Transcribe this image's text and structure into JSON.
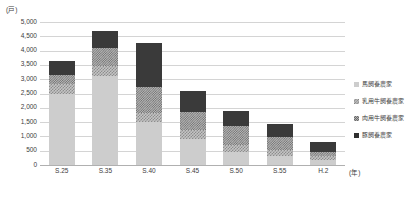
{
  "chart_data": {
    "type": "bar",
    "subtype": "stacked-bar",
    "title": "",
    "xlabel": "年",
    "ylabel": "戸",
    "y_unit_label": "(戸)",
    "x_unit_label": "(年)",
    "ylim": [
      0,
      5000
    ],
    "ytick_step": 500,
    "grid": true,
    "legend_position": "right",
    "categories": [
      "S.25",
      "S.35",
      "S.40",
      "S.45",
      "S.50",
      "S.55",
      "H.2"
    ],
    "yticks": [
      "0",
      "500",
      "1,000",
      "1,500",
      "2,000",
      "2,500",
      "3,000",
      "3,500",
      "4,000",
      "4,500",
      "5,000"
    ],
    "series": [
      {
        "name": "馬飼養農家",
        "key": "horse",
        "color": "#cdcdcd",
        "values": [
          2500,
          3100,
          1500,
          900,
          450,
          300,
          180
        ]
      },
      {
        "name": "乳用牛飼養農家",
        "key": "dairy",
        "color": "#c4c4c4",
        "values": [
          330,
          350,
          320,
          330,
          260,
          240,
          150
        ]
      },
      {
        "name": "肉用牛飼養農家",
        "key": "beef",
        "color": "#b5b5b5",
        "values": [
          300,
          650,
          900,
          620,
          640,
          440,
          130
        ]
      },
      {
        "name": "豚飼養農家",
        "key": "pig",
        "color": "#3a3a3a",
        "values": [
          520,
          600,
          1530,
          750,
          550,
          470,
          340
        ]
      }
    ],
    "totals": [
      3650,
      4700,
      4250,
      2600,
      1900,
      1450,
      800
    ]
  },
  "legend": {
    "items": [
      {
        "label": "馬飼養農家",
        "key": "horse"
      },
      {
        "label": "乳用牛飼養農家",
        "key": "dairy"
      },
      {
        "label": "肉用牛飼養農家",
        "key": "beef"
      },
      {
        "label": "豚飼養農家",
        "key": "pig"
      }
    ]
  }
}
